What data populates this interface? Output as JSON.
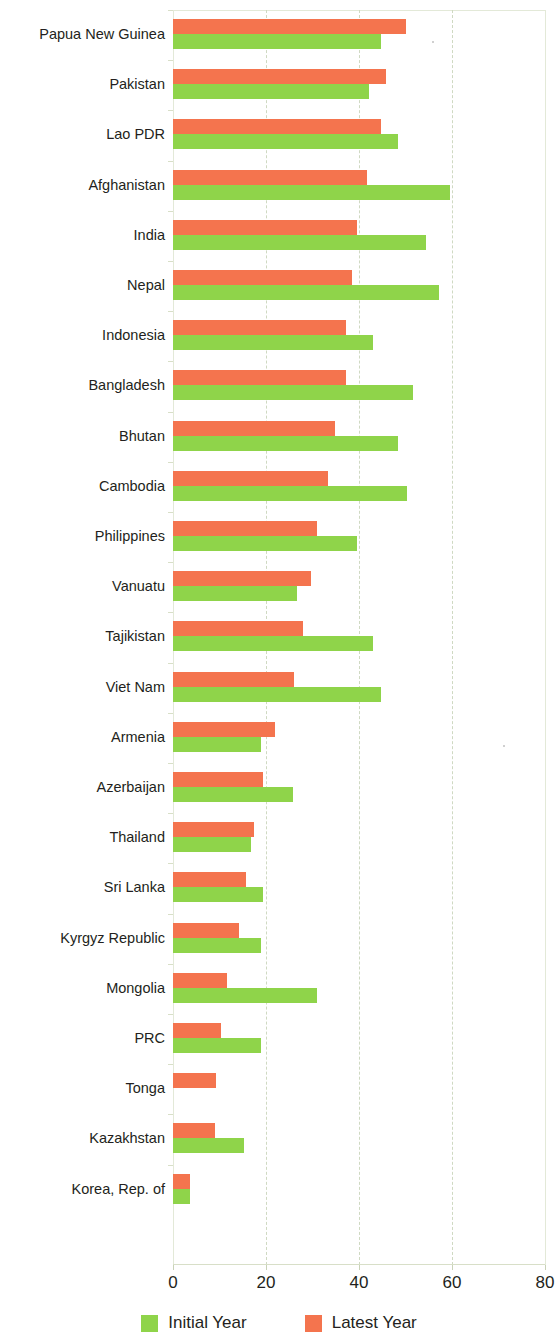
{
  "chart_data": {
    "type": "bar",
    "orientation": "horizontal",
    "title": "",
    "xlabel": "",
    "ylabel": "",
    "xlim": [
      0,
      80
    ],
    "xticks": [
      0,
      20,
      40,
      60,
      80
    ],
    "xtick_labels": [
      "0",
      "20",
      "40",
      "60",
      "80"
    ],
    "grid": true,
    "legend_position": "bottom-center",
    "categories": [
      "Papua New Guinea",
      "Pakistan",
      "Lao PDR",
      "Afghanistan",
      "India",
      "Nepal",
      "Indonesia",
      "Bangladesh",
      "Bhutan",
      "Cambodia",
      "Philippines",
      "Vanuatu",
      "Tajikistan",
      "Viet Nam",
      "Armenia",
      "Azerbaijan",
      "Thailand",
      "Sri Lanka",
      "Kyrgyz Republic",
      "Mongolia",
      "PRC",
      "Tonga",
      "Kazakhstan",
      "Korea, Rep. of"
    ],
    "series": [
      {
        "name": "Initial Year",
        "color": "#8fd44a",
        "values": [
          44.7,
          42.1,
          48.4,
          59.6,
          54.4,
          57.2,
          43.0,
          51.6,
          48.4,
          50.3,
          39.5,
          26.6,
          43.0,
          44.7,
          18.9,
          25.9,
          16.7,
          19.4,
          18.9,
          30.9,
          19.0,
          0,
          15.3,
          3.7
        ]
      },
      {
        "name": "Latest Year",
        "color": "#f4744e",
        "values": [
          50.1,
          45.8,
          44.7,
          41.7,
          39.5,
          38.5,
          37.1,
          37.1,
          34.8,
          33.3,
          30.9,
          29.6,
          27.9,
          26.1,
          22.0,
          19.3,
          17.5,
          15.8,
          14.1,
          11.7,
          10.4,
          9.3,
          9.1,
          3.7
        ]
      }
    ]
  },
  "legend": {
    "items": [
      {
        "label": "Initial Year",
        "swatch": "initial"
      },
      {
        "label": "Latest Year",
        "swatch": "latest"
      }
    ]
  }
}
